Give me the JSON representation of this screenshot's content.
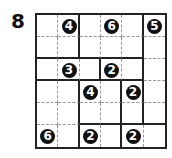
{
  "puzzle": {
    "number_label": "8",
    "rows": 6,
    "cols": 6,
    "regions": [
      [
        "A",
        "A",
        "B",
        "B",
        "B",
        "C"
      ],
      [
        "A",
        "A",
        "B",
        "B",
        "B",
        "C"
      ],
      [
        "D",
        "D",
        "D",
        "E",
        "E",
        "C"
      ],
      [
        "F",
        "F",
        "G",
        "G",
        "H",
        "C"
      ],
      [
        "F",
        "F",
        "G",
        "G",
        "H",
        "C"
      ],
      [
        "F",
        "F",
        "I",
        "I",
        "J",
        "J"
      ]
    ],
    "clues": [
      {
        "row": 0,
        "col": 1,
        "value": "4"
      },
      {
        "row": 0,
        "col": 3,
        "value": "6"
      },
      {
        "row": 0,
        "col": 5,
        "value": "5"
      },
      {
        "row": 2,
        "col": 1,
        "value": "3"
      },
      {
        "row": 2,
        "col": 3,
        "value": "2"
      },
      {
        "row": 3,
        "col": 2,
        "value": "4"
      },
      {
        "row": 3,
        "col": 4,
        "value": "2"
      },
      {
        "row": 5,
        "col": 0,
        "value": "6"
      },
      {
        "row": 5,
        "col": 2,
        "value": "2"
      },
      {
        "row": 5,
        "col": 4,
        "value": "2"
      }
    ],
    "colors": {
      "line": "#222222",
      "dash": "#9a9a9a",
      "clue_bg": "#111111",
      "clue_text": "#ffffff"
    }
  }
}
